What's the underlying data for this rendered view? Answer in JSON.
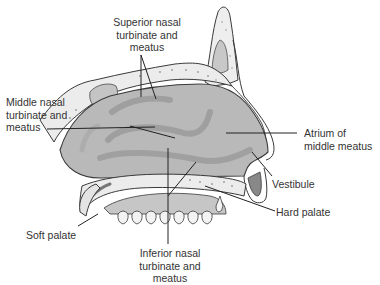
{
  "diagram": {
    "labels": {
      "superior": {
        "lines": [
          "Superior nasal",
          "turbinate and",
          "meatus"
        ]
      },
      "middle": {
        "lines": [
          "Middle nasal",
          "turbinate and",
          "meatus"
        ]
      },
      "atrium": {
        "lines": [
          "Atrium of",
          "middle meatus"
        ]
      },
      "vestibule": {
        "lines": [
          "Vestibule"
        ]
      },
      "hard_palate": {
        "lines": [
          "Hard palate"
        ]
      },
      "soft_palate": {
        "lines": [
          "Soft palate"
        ]
      },
      "inferior": {
        "lines": [
          "Inferior nasal",
          "turbinate and",
          "meatus"
        ]
      }
    },
    "colors": {
      "cavity_fill": "#b9b9b9",
      "turbinate_shade": "#9a9a9a",
      "bone_fill": "#ececec",
      "outline": "#3a3a3a",
      "leader_line": "#222222"
    }
  }
}
